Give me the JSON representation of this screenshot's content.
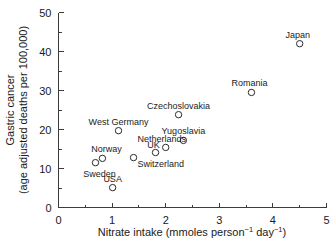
{
  "chart_data": {
    "type": "scatter",
    "title": "",
    "xlabel": "Nitrate intake (mmoles person⁻¹ day⁻¹)",
    "xlabel_parts": {
      "main": "Nitrate intake (mmoles person",
      "sup1": "−1",
      "mid": " day",
      "sup2": "−1",
      "end": ")"
    },
    "ylabel_line1": "Gastric cancer",
    "ylabel_line2": "(age adjusted deaths per 100,000)",
    "xlim": [
      0,
      5
    ],
    "ylim": [
      0,
      50
    ],
    "xticks": [
      0,
      1,
      2,
      3,
      4,
      5
    ],
    "yticks": [
      0,
      10,
      20,
      30,
      40,
      50
    ],
    "xtick_labels": [
      "0",
      "1",
      "2",
      "3",
      "4",
      "5"
    ],
    "ytick_labels": [
      "0",
      "10",
      "20",
      "30",
      "40",
      "50"
    ],
    "x_minor_ticks": [
      0.5,
      1.5,
      2.5,
      3.5,
      4.5
    ],
    "y_minor_ticks": [
      5,
      15,
      25,
      35,
      45
    ],
    "grid": false,
    "legend": "none",
    "marker_style": "open-circle",
    "marker_color": "#2b2b2b",
    "points": [
      {
        "label": "Japan",
        "x": 4.5,
        "y": 42.0,
        "label_dx": -2,
        "label_dy": -6,
        "anchor": "middle"
      },
      {
        "label": "Romania",
        "x": 3.6,
        "y": 29.5,
        "label_dx": -2,
        "label_dy": -6,
        "anchor": "middle"
      },
      {
        "label": "Czechoslovakia",
        "x": 2.24,
        "y": 23.8,
        "label_dx": 0,
        "label_dy": -6,
        "anchor": "middle"
      },
      {
        "label": "West Germany",
        "x": 1.12,
        "y": 19.7,
        "label_dx": 0,
        "label_dy": -6,
        "anchor": "middle"
      },
      {
        "label": "Yugoslavia",
        "x": 2.33,
        "y": 17.2,
        "label_dx": 0,
        "label_dy": -6,
        "anchor": "middle"
      },
      {
        "label": "Netherlands",
        "x": 2.0,
        "y": 15.4,
        "label_dx": -4,
        "label_dy": -5,
        "anchor": "middle"
      },
      {
        "label": "UK",
        "x": 1.81,
        "y": 14.1,
        "label_dx": -2,
        "label_dy": -5,
        "anchor": "middle"
      },
      {
        "label": "Switzerland",
        "x": 1.4,
        "y": 12.8,
        "label_dx": 4,
        "label_dy": 9,
        "anchor": "start"
      },
      {
        "label": "Norway",
        "x": 0.82,
        "y": 12.6,
        "label_dx": 4,
        "label_dy": -6,
        "anchor": "middle"
      },
      {
        "label": "Sweden",
        "x": 0.69,
        "y": 11.5,
        "label_dx": 4,
        "label_dy": 14,
        "anchor": "middle"
      },
      {
        "label": "USA",
        "x": 1.01,
        "y": 5.1,
        "label_dx": 0,
        "label_dy": -6,
        "anchor": "middle"
      }
    ]
  }
}
